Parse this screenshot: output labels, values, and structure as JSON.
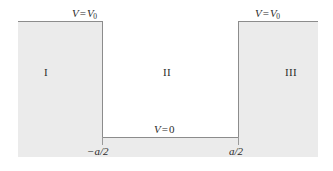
{
  "figure": {
    "type": "finite-square-well-potential-diagram",
    "colors": {
      "shade": "#ebebeb",
      "stroke": "#8c8c8c",
      "text": "#2b2b2b",
      "background": "#ffffff"
    }
  },
  "labels": {
    "barrier_left_potential": {
      "variable": "V",
      "operator": "=",
      "value": "V",
      "subscript": "0"
    },
    "barrier_right_potential": {
      "variable": "V",
      "operator": "=",
      "value": "V",
      "subscript": "0"
    },
    "well_potential": {
      "variable": "V",
      "operator": "=",
      "value": "0"
    },
    "tick_left": "−a/2",
    "tick_right": "a/2",
    "region_one": "I",
    "region_two": "II",
    "region_three": "III"
  },
  "chart_data": {
    "type": "line",
    "title": "",
    "xlabel": "",
    "ylabel": "",
    "x_tick_labels": [
      "−a/2",
      "a/2"
    ],
    "x_tick_values": [
      -0.5,
      0.5
    ],
    "y_tick_labels": [
      "V = 0",
      "V = V0"
    ],
    "regions": [
      {
        "name": "I",
        "domain": "x < -a/2",
        "potential": "V0"
      },
      {
        "name": "II",
        "domain": "-a/2 < x < a/2",
        "potential": "0"
      },
      {
        "name": "III",
        "domain": "x > a/2",
        "potential": "V0"
      }
    ],
    "series": [
      {
        "name": "V(x)",
        "x": [
          -1.15,
          -0.5,
          -0.5,
          0.5,
          0.5,
          1.1
        ],
        "values": [
          1,
          1,
          0,
          0,
          1,
          1
        ]
      }
    ],
    "grid": false,
    "legend": "none"
  }
}
